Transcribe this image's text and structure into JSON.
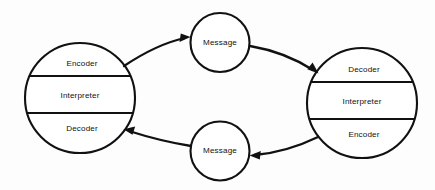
{
  "diagram": {
    "background_color": "#fdfdfd",
    "line_color": "#111111",
    "nodes": {
      "left_communicator": {
        "name": "left-communicator",
        "segments": [
          {
            "label": "Encoder",
            "position": "top"
          },
          {
            "label": "Interpreter",
            "position": "middle"
          },
          {
            "label": "Decoder",
            "position": "bottom"
          }
        ]
      },
      "right_communicator": {
        "name": "right-communicator",
        "segments": [
          {
            "label": "Decoder",
            "position": "top"
          },
          {
            "label": "Interpreter",
            "position": "middle"
          },
          {
            "label": "Encoder",
            "position": "bottom"
          }
        ]
      },
      "top_message": {
        "label": "Message"
      },
      "bottom_message": {
        "label": "Message"
      }
    },
    "arrows": [
      {
        "name": "left-to-top-message",
        "direction": "right"
      },
      {
        "name": "top-message-to-right",
        "direction": "right"
      },
      {
        "name": "right-to-bottom-message",
        "direction": "left"
      },
      {
        "name": "bottom-message-to-left",
        "direction": "left"
      }
    ]
  }
}
